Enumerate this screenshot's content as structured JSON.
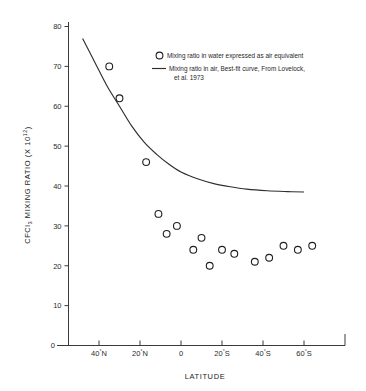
{
  "chart_data": {
    "type": "scatter",
    "title": "",
    "xlabel": "LATITUDE",
    "ylabel": "CFCl3 MIXING RATIO (X 10^12)",
    "ylabel_parts": {
      "prefix": "CFCl",
      "subscript": "3",
      "middle": " MIXING RATIO (X 10",
      "superscript": "12",
      "suffix": ")"
    },
    "grid": false,
    "xlim": [
      50,
      -70
    ],
    "ylim": [
      0,
      80
    ],
    "yticks": [
      10,
      20,
      30,
      40,
      50,
      60,
      70,
      80
    ],
    "ytick_labels": [
      "10",
      "20",
      "30",
      "40",
      "50",
      "60",
      "70",
      "80"
    ],
    "y_origin_label": "0",
    "xticks": [
      40,
      20,
      0,
      -20,
      -40,
      -60
    ],
    "xtick_labels": [
      "40°N",
      "20°N",
      "0",
      "20°S",
      "40°S",
      "60°S"
    ],
    "xtick_label_parts": [
      {
        "value": "40",
        "deg": "°",
        "hemi": "N"
      },
      {
        "value": "20",
        "deg": "°",
        "hemi": "N"
      },
      {
        "value": "0",
        "deg": "",
        "hemi": ""
      },
      {
        "value": "20",
        "deg": "°",
        "hemi": "S"
      },
      {
        "value": "40",
        "deg": "°",
        "hemi": "S"
      },
      {
        "value": "60",
        "deg": "°",
        "hemi": "S"
      }
    ],
    "series": [
      {
        "name": "Mixing ratio in water expressed as air equivalent",
        "type": "scatter",
        "marker": "open-circle",
        "color": "#1f1f1f",
        "points": [
          {
            "latitude": 35,
            "value": 70
          },
          {
            "latitude": 30,
            "value": 62
          },
          {
            "latitude": 17,
            "value": 46
          },
          {
            "latitude": 11,
            "value": 33
          },
          {
            "latitude": 7,
            "value": 28
          },
          {
            "latitude": 2,
            "value": 30
          },
          {
            "latitude": -6,
            "value": 24
          },
          {
            "latitude": -10,
            "value": 27
          },
          {
            "latitude": -14,
            "value": 20
          },
          {
            "latitude": -20,
            "value": 24
          },
          {
            "latitude": -26,
            "value": 23
          },
          {
            "latitude": -36,
            "value": 21
          },
          {
            "latitude": -50,
            "value": 25
          },
          {
            "latitude": -57,
            "value": 24
          },
          {
            "latitude": -64,
            "value": 25
          },
          {
            "latitude": -43,
            "value": 22
          }
        ]
      },
      {
        "name": "Mixing ratio in air, Best-fit curve, From Lovelock, et al. 1973",
        "type": "line",
        "color": "#2f2f2f",
        "points": [
          {
            "latitude": 48,
            "value": 77
          },
          {
            "latitude": 42,
            "value": 71
          },
          {
            "latitude": 36,
            "value": 65
          },
          {
            "latitude": 30,
            "value": 60
          },
          {
            "latitude": 24,
            "value": 55
          },
          {
            "latitude": 18,
            "value": 51
          },
          {
            "latitude": 12,
            "value": 48
          },
          {
            "latitude": 6,
            "value": 45.5
          },
          {
            "latitude": 0,
            "value": 43.5
          },
          {
            "latitude": -8,
            "value": 41.8
          },
          {
            "latitude": -16,
            "value": 40.6
          },
          {
            "latitude": -24,
            "value": 39.8
          },
          {
            "latitude": -32,
            "value": 39.2
          },
          {
            "latitude": -42,
            "value": 38.8
          },
          {
            "latitude": -52,
            "value": 38.6
          },
          {
            "latitude": -60,
            "value": 38.5
          }
        ]
      }
    ],
    "legend": {
      "position": "top-right-inside",
      "entries": [
        {
          "symbol": "open-circle",
          "label": "Mixing ratio in water expressed as air equivalent",
          "label_line2": ""
        },
        {
          "symbol": "line",
          "label": "Mixing ratio in air, Best-fit curve, From Lovelock,",
          "label_line2": "et al. 1973"
        }
      ]
    }
  }
}
